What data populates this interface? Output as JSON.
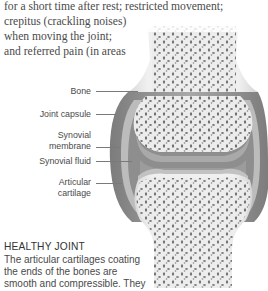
{
  "body_text": {
    "lines": [
      "for a short time after rest; restricted movement;",
      "crepitus (crackling noises)",
      "when moving the joint;",
      "and referred pain (in areas"
    ]
  },
  "illustration": {
    "title": "Healthy joint cross-section",
    "labels": [
      {
        "text": "Bone"
      },
      {
        "text": "Joint capsule"
      },
      {
        "text": "Synovial membrane",
        "lines": [
          "Synovial",
          "membrane"
        ]
      },
      {
        "text": "Synovial fluid"
      },
      {
        "text": "Articular cartilage",
        "lines": [
          "Articular",
          "cartilage"
        ]
      }
    ],
    "colors": {
      "bone": "#ebebeb",
      "bone_pores": "#5a5a5a",
      "capsule": "#8c8c8c",
      "cartilage": "#bdbdbd",
      "fluid": "#9a9a9a"
    }
  },
  "caption": {
    "heading": "HEALTHY JOINT",
    "lines": [
      "The articular cartilages coating",
      "the ends of the bones are",
      "smooth and compressible. They"
    ]
  }
}
